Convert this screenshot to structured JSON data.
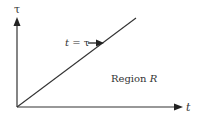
{
  "diagram": {
    "y_axis_label": "τ",
    "x_axis_label": "t",
    "line_label_var": "t",
    "line_label_eq": " = τ",
    "region_label_prefix": "Region ",
    "region_label_var": "R",
    "colors": {
      "stroke": "#333333",
      "background": "#ffffff"
    }
  }
}
